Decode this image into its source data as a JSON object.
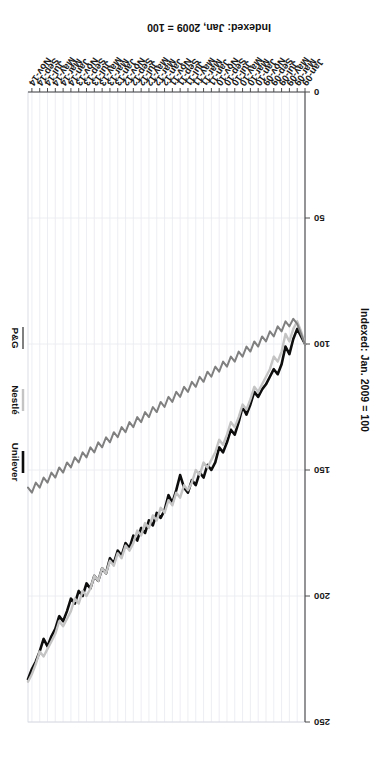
{
  "figure": {
    "orientation_degrees": 180,
    "background_color": "#ffffff",
    "plot_border_color": "#4d4d4d",
    "gridline_color": "#e8eaf0"
  },
  "legend": {
    "position": "right",
    "entries": [
      {
        "label": "Unilever",
        "color": "#0d0d0d",
        "width": 2.6
      },
      {
        "label": "Nestlé",
        "color": "#c4c4c4",
        "width": 2.4
      },
      {
        "label": "P&G",
        "color": "#808080",
        "width": 2.0
      }
    ]
  },
  "axis_titles": {
    "value_axis": "Indexed: Jan. 2009 = 100",
    "value_axis_secondary": "Indexed: Jan, 2009 = 100"
  },
  "chart_data": {
    "type": "line",
    "title": "",
    "subtitle": "",
    "xlabel": "",
    "ylabel": "Indexed: Jan. 2009 = 100",
    "ylim": [
      0,
      250
    ],
    "yticks": [
      0,
      50,
      100,
      150,
      200,
      250
    ],
    "ytick_labels": [
      "0",
      "50",
      "100",
      "150",
      "200",
      "250"
    ],
    "grid": true,
    "legend_position": "right",
    "x": [
      "Jan-09",
      "Feb-09",
      "Mar-09",
      "Apr-09",
      "May-09",
      "Jun-09",
      "Jul-09",
      "Aug-09",
      "Sep-09",
      "Oct-09",
      "Nov-09",
      "Dec-09",
      "Jan-10",
      "Feb-10",
      "Mar-10",
      "Apr-10",
      "May-10",
      "Jun-10",
      "Jul-10",
      "Aug-10",
      "Sep-10",
      "Oct-10",
      "Nov-10",
      "Dec-10",
      "Jan-11",
      "Feb-11",
      "Mar-11",
      "Apr-11",
      "May-11",
      "Jun-11",
      "Jul-11",
      "Aug-11",
      "Sep-11",
      "Oct-11",
      "Nov-11",
      "Dec-11",
      "Jan-12",
      "Feb-12",
      "Mar-12",
      "Apr-12",
      "May-12",
      "Jun-12",
      "Jul-12",
      "Aug-12",
      "Sep-12",
      "Oct-12",
      "Nov-12",
      "Dec-12",
      "Jan-13",
      "Feb-13",
      "Mar-13",
      "Apr-13",
      "May-13",
      "Jun-13",
      "Jul-13",
      "Aug-13",
      "Sep-13",
      "Oct-13",
      "Nov-13",
      "Dec-13",
      "Jan-14",
      "Feb-14",
      "Mar-14",
      "Apr-14",
      "May-14",
      "Jun-14",
      "Jul-14",
      "Aug-14",
      "Sep-14",
      "Oct-14",
      "Nov-14",
      "Dec-14"
    ],
    "xtick_labels": [
      "Jan-09",
      "Mar-09",
      "May-09",
      "Jul-09",
      "Sep-09",
      "Nov-09",
      "Jan-10",
      "Mar-10",
      "May-10",
      "Jul-10",
      "Sep-10",
      "Nov-10",
      "Jan-11",
      "Mar-11",
      "May-11",
      "Jul-11",
      "Sep-11",
      "Nov-11",
      "Jan-12",
      "Mar-12",
      "May-12",
      "Jul-12",
      "Sep-12",
      "Nov-12",
      "Jan-13",
      "Mar-13",
      "May-13",
      "Jul-13",
      "Sep-13",
      "Nov-13",
      "Jan-14",
      "Mar-14",
      "May-14",
      "Jul-14",
      "Sep-14",
      "Nov-14"
    ],
    "series": [
      {
        "name": "Unilever",
        "color": "#0d0d0d",
        "values": [
          100,
          97,
          94,
          98,
          104,
          101,
          108,
          112,
          110,
          113,
          116,
          118,
          121,
          119,
          124,
          128,
          125,
          131,
          136,
          134,
          139,
          143,
          141,
          147,
          150,
          148,
          153,
          151,
          156,
          154,
          159,
          157,
          152,
          158,
          163,
          160,
          166,
          169,
          167,
          172,
          170,
          175,
          173,
          178,
          176,
          181,
          179,
          184,
          182,
          187,
          185,
          191,
          189,
          194,
          192,
          197,
          195,
          200,
          198,
          203,
          201,
          206,
          210,
          208,
          213,
          216,
          220,
          217,
          222,
          226,
          229,
          233
        ]
      },
      {
        "name": "Nestlé",
        "color": "#c4c4c4",
        "values": [
          100,
          95,
          91,
          94,
          99,
          96,
          103,
          107,
          105,
          110,
          113,
          116,
          119,
          117,
          122,
          126,
          124,
          129,
          133,
          131,
          136,
          140,
          138,
          143,
          146,
          149,
          147,
          152,
          150,
          155,
          158,
          156,
          161,
          159,
          164,
          162,
          167,
          165,
          170,
          168,
          173,
          171,
          176,
          174,
          179,
          182,
          180,
          185,
          183,
          188,
          186,
          191,
          189,
          194,
          192,
          197,
          200,
          198,
          203,
          201,
          206,
          209,
          212,
          210,
          215,
          218,
          221,
          224,
          222,
          227,
          231,
          234
        ]
      },
      {
        "name": "P&G",
        "color": "#808080",
        "values": [
          100,
          96,
          92,
          90,
          93,
          91,
          95,
          93,
          97,
          95,
          99,
          97,
          101,
          99,
          103,
          101,
          105,
          103,
          107,
          105,
          109,
          107,
          111,
          109,
          113,
          111,
          115,
          113,
          117,
          115,
          119,
          117,
          121,
          119,
          123,
          121,
          125,
          123,
          127,
          125,
          129,
          127,
          131,
          129,
          133,
          131,
          135,
          133,
          137,
          135,
          139,
          137,
          141,
          139,
          143,
          141,
          145,
          143,
          147,
          145,
          149,
          147,
          151,
          149,
          153,
          151,
          155,
          153,
          157,
          155,
          159,
          157
        ]
      }
    ]
  }
}
